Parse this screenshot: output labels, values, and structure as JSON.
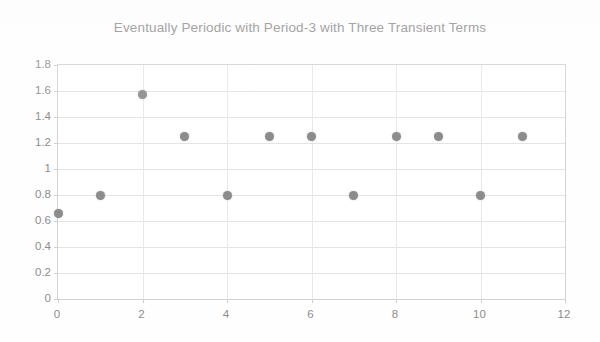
{
  "chart_data": {
    "type": "scatter",
    "title": "Eventually Periodic with Period-3 with Three Transient Terms",
    "xlabel": "",
    "ylabel": "",
    "xlim": [
      0,
      12
    ],
    "ylim": [
      0,
      1.8
    ],
    "grid": true,
    "legend": null,
    "marker_color": "#8c8c8c",
    "x": [
      0,
      1,
      2,
      3,
      4,
      5,
      6,
      7,
      8,
      9,
      10,
      11
    ],
    "y": [
      0.66,
      0.8,
      1.57,
      1.25,
      0.8,
      1.25,
      1.25,
      0.8,
      1.25,
      1.25,
      0.8,
      1.25
    ],
    "points": [
      {
        "x": 0,
        "y": 0.66
      },
      {
        "x": 1,
        "y": 0.8
      },
      {
        "x": 2,
        "y": 1.57
      },
      {
        "x": 3,
        "y": 1.25
      },
      {
        "x": 4,
        "y": 0.8
      },
      {
        "x": 5,
        "y": 1.25
      },
      {
        "x": 6,
        "y": 1.25
      },
      {
        "x": 7,
        "y": 0.8
      },
      {
        "x": 8,
        "y": 1.25
      },
      {
        "x": 9,
        "y": 1.25
      },
      {
        "x": 10,
        "y": 0.8
      },
      {
        "x": 11,
        "y": 1.25
      }
    ],
    "yticks": [
      0,
      0.2,
      0.4,
      0.6,
      0.8,
      1,
      1.2,
      1.4,
      1.6,
      1.8
    ],
    "ytick_labels": [
      "0",
      "0.2",
      "0.4",
      "0.6",
      "0.8",
      "1",
      "1.2",
      "1.4",
      "1.6",
      "1.8"
    ],
    "xticks": [
      0,
      2,
      4,
      6,
      8,
      10,
      12
    ],
    "xtick_labels": [
      "0",
      "2",
      "4",
      "6",
      "8",
      "10",
      "12"
    ]
  },
  "style": {
    "axis_color": "#d3d3d3",
    "grid_color": "#e4e4e4",
    "text_color": "#8d8d8d",
    "background": "#ffffff"
  }
}
